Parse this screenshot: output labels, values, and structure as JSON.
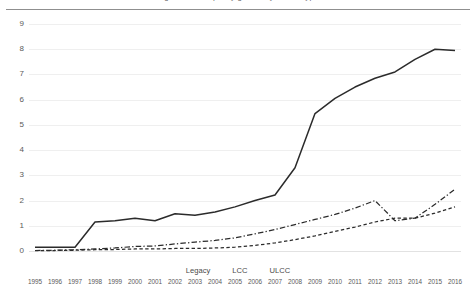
{
  "figure": {
    "title_fragment": "Figure: seat capacity growth by carrier type",
    "top_rule": true
  },
  "axes": {
    "y_ticks": [
      "0",
      "1",
      "2",
      "3",
      "4",
      "5",
      "6",
      "7",
      "8",
      "9"
    ],
    "x_ticks": [
      "1995",
      "1996",
      "1997",
      "1998",
      "1999",
      "2000",
      "2001",
      "2002",
      "2003",
      "2004",
      "2005",
      "2006",
      "2007",
      "2008",
      "2009",
      "2010",
      "2011",
      "2012",
      "2013",
      "2014",
      "2015",
      "2016"
    ]
  },
  "legend": {
    "items": [
      {
        "label": "Legacy",
        "style": "solid",
        "color": "#2b2b2b"
      },
      {
        "label": "LCC",
        "style": "dash-dot",
        "color": "#2b2b2b"
      },
      {
        "label": "ULCC",
        "style": "dashed",
        "color": "#2b2b2b"
      }
    ]
  },
  "chart_data": {
    "type": "line",
    "title": "",
    "xlabel": "",
    "ylabel": "",
    "xlim": [
      1995,
      2016
    ],
    "ylim": [
      0,
      9
    ],
    "grid": true,
    "legend_position": "bottom",
    "categories": [
      "1995",
      "1996",
      "1997",
      "1998",
      "1999",
      "2000",
      "2001",
      "2002",
      "2003",
      "2004",
      "2005",
      "2006",
      "2007",
      "2008",
      "2009",
      "2010",
      "2011",
      "2012",
      "2013",
      "2014",
      "2015",
      "2016"
    ],
    "series": [
      {
        "name": "Legacy",
        "style": "solid",
        "color": "#2b2b2b",
        "values": [
          0.15,
          0.15,
          0.15,
          1.15,
          1.2,
          1.3,
          1.2,
          1.48,
          1.42,
          1.55,
          1.75,
          2.0,
          2.22,
          3.3,
          5.45,
          6.05,
          6.5,
          6.85,
          7.1,
          7.6,
          8.0,
          7.95
        ]
      },
      {
        "name": "LCC",
        "style": "dash-dot",
        "color": "#2b2b2b",
        "values": [
          0.02,
          0.03,
          0.05,
          0.08,
          0.12,
          0.18,
          0.2,
          0.28,
          0.35,
          0.42,
          0.52,
          0.68,
          0.85,
          1.05,
          1.25,
          1.45,
          1.7,
          2.0,
          1.2,
          1.3,
          1.85,
          2.45
        ]
      },
      {
        "name": "ULCC",
        "style": "dashed",
        "color": "#2b2b2b",
        "values": [
          0.02,
          0.02,
          0.03,
          0.05,
          0.06,
          0.08,
          0.08,
          0.1,
          0.1,
          0.12,
          0.15,
          0.22,
          0.32,
          0.45,
          0.6,
          0.78,
          0.95,
          1.15,
          1.3,
          1.3,
          1.5,
          1.75
        ]
      }
    ]
  }
}
